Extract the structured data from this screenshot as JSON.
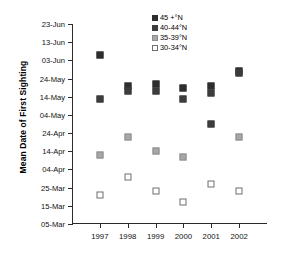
{
  "chart_data": {
    "type": "scatter",
    "title": "",
    "xlabel": "",
    "ylabel": "Mean Date of First Sighting",
    "categories": [
      "1997",
      "1998",
      "1999",
      "2000",
      "2001",
      "2002"
    ],
    "x_tick_labels": [
      "1997",
      "1998",
      "1999",
      "2000",
      "2001",
      "2002"
    ],
    "y_tick_labels": [
      "23-Jun",
      "13-Jun",
      "03-Jun",
      "24-May",
      "14-May",
      "04-May",
      "24-Apr",
      "14-Apr",
      "04-Apr",
      "25-Mar",
      "15-Mar",
      "05-Mar"
    ],
    "y_tick_values": [
      174,
      164,
      154,
      144,
      134,
      124,
      114,
      104,
      94,
      84,
      74,
      64
    ],
    "ylim": [
      64,
      174
    ],
    "y_axis_note": "values are day-of-year; axis inverted (latest date at top)",
    "grid": false,
    "legend_position": "top-right",
    "series": [
      {
        "name": "45 +°N",
        "marker": "filled-square",
        "color": "#2e2e2e",
        "points": [
          {
            "x": "1997",
            "label": "06-Jun",
            "value": 157
          },
          {
            "x": "1998",
            "label": "20-May",
            "value": 140
          },
          {
            "x": "1999",
            "label": "21-May",
            "value": 141
          },
          {
            "x": "2000",
            "label": "19-May",
            "value": 139
          },
          {
            "x": "2001",
            "label": "20-May",
            "value": 140
          },
          {
            "x": "2002",
            "label": "28-May",
            "value": 148
          }
        ]
      },
      {
        "name": "40-44°N",
        "marker": "filled-square",
        "color": "#3c3c3c",
        "points": [
          {
            "x": "1997",
            "label": "13-May",
            "value": 133
          },
          {
            "x": "1998",
            "label": "17-May",
            "value": 137
          },
          {
            "x": "1999",
            "label": "17-May",
            "value": 137
          },
          {
            "x": "2000",
            "label": "13-May",
            "value": 133
          },
          {
            "x": "2001",
            "label": "16-May",
            "value": 136
          },
          {
            "x": "2001",
            "label": "29-Apr",
            "value": 119
          },
          {
            "x": "2002",
            "label": "27-May",
            "value": 147
          }
        ]
      },
      {
        "name": "35-39°N",
        "marker": "grey-square",
        "color": "#a7a7a7",
        "points": [
          {
            "x": "1997",
            "label": "12-Apr",
            "value": 102
          },
          {
            "x": "1998",
            "label": "22-Apr",
            "value": 112
          },
          {
            "x": "1999",
            "label": "14-Apr",
            "value": 104
          },
          {
            "x": "2000",
            "label": "11-Apr",
            "value": 101
          },
          {
            "x": "2002",
            "label": "22-Apr",
            "value": 112
          }
        ]
      },
      {
        "name": "30-34°N",
        "marker": "open-square",
        "color": "#ffffff",
        "points": [
          {
            "x": "1997",
            "label": "21-Mar",
            "value": 80
          },
          {
            "x": "1998",
            "label": "31-Mar",
            "value": 90
          },
          {
            "x": "1999",
            "label": "23-Mar",
            "value": 82
          },
          {
            "x": "2000",
            "label": "17-Mar",
            "value": 76
          },
          {
            "x": "2001",
            "label": "27-Mar",
            "value": 86
          },
          {
            "x": "2002",
            "label": "23-Mar",
            "value": 82
          }
        ]
      }
    ]
  },
  "legend": {
    "entries": [
      {
        "label": "45 +°N"
      },
      {
        "label": "40-44°N"
      },
      {
        "label": "35-39°N"
      },
      {
        "label": "30-34°N"
      }
    ]
  },
  "axis": {
    "y_title": "Mean Date of First Sighting"
  }
}
